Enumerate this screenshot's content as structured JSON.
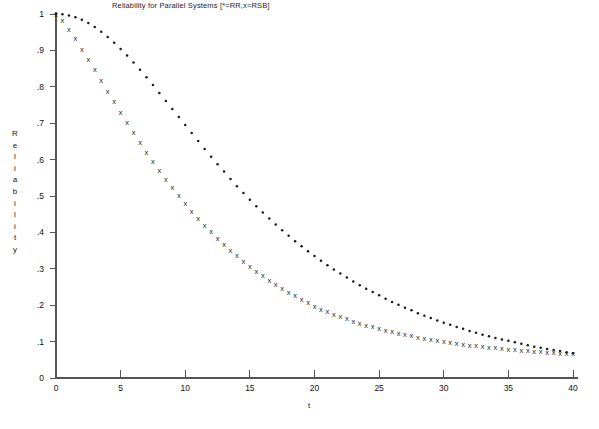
{
  "chart_data": {
    "type": "scatter",
    "title": "Reliability for Parallel Systems [*=RR,x=RSB]",
    "xlabel": "t",
    "ylabel": "Reliability",
    "ylabel_letters": [
      "R",
      "e",
      "l",
      "i",
      "a",
      "b",
      "i",
      "l",
      "i",
      "t",
      "y"
    ],
    "xlim": [
      0,
      40
    ],
    "ylim": [
      0,
      1
    ],
    "grid": false,
    "legend": "in-title",
    "xticks": [
      0,
      5,
      10,
      15,
      20,
      25,
      30,
      35,
      40
    ],
    "xtick_labels": [
      "0",
      "5",
      "10",
      "15",
      "20",
      "25",
      "30",
      "35",
      "40"
    ],
    "yticks": [
      0,
      0.1,
      0.2,
      0.3,
      0.4,
      0.5,
      0.6,
      0.7,
      0.8,
      0.9,
      1
    ],
    "ytick_labels": [
      "0",
      ".1",
      ".2",
      ".3",
      ".4",
      ".5",
      ".6",
      ".7",
      ".8",
      ".9",
      "1"
    ],
    "x": [
      0,
      0.5,
      1,
      1.5,
      2,
      2.5,
      3,
      3.5,
      4,
      4.5,
      5,
      5.5,
      6,
      6.5,
      7,
      7.5,
      8,
      8.5,
      9,
      9.5,
      10,
      10.5,
      11,
      11.5,
      12,
      12.5,
      13,
      13.5,
      14,
      14.5,
      15,
      15.5,
      16,
      16.5,
      17,
      17.5,
      18,
      18.5,
      19,
      19.5,
      20,
      20.5,
      21,
      21.5,
      22,
      22.5,
      23,
      23.5,
      24,
      24.5,
      25,
      25.5,
      26,
      26.5,
      27,
      27.5,
      28,
      28.5,
      29,
      29.5,
      30,
      30.5,
      31,
      31.5,
      32,
      32.5,
      33,
      33.5,
      34,
      34.5,
      35,
      35.5,
      36,
      36.5,
      37,
      37.5,
      38,
      38.5,
      39,
      39.5,
      40
    ],
    "series": [
      {
        "name": "RR",
        "marker": "*",
        "marker_name": "star-marker",
        "color": "#1a1a1a",
        "values": [
          1.0,
          0.999,
          0.996,
          0.991,
          0.984,
          0.975,
          0.964,
          0.951,
          0.937,
          0.921,
          0.904,
          0.886,
          0.867,
          0.847,
          0.826,
          0.805,
          0.783,
          0.761,
          0.739,
          0.717,
          0.695,
          0.673,
          0.651,
          0.629,
          0.608,
          0.587,
          0.567,
          0.547,
          0.527,
          0.508,
          0.49,
          0.472,
          0.455,
          0.438,
          0.422,
          0.406,
          0.391,
          0.376,
          0.362,
          0.348,
          0.335,
          0.322,
          0.31,
          0.298,
          0.287,
          0.276,
          0.265,
          0.255,
          0.245,
          0.236,
          0.227,
          0.218,
          0.209,
          0.201,
          0.193,
          0.186,
          0.178,
          0.171,
          0.165,
          0.158,
          0.152,
          0.146,
          0.14,
          0.135,
          0.129,
          0.124,
          0.119,
          0.115,
          0.11,
          0.106,
          0.102,
          0.098,
          0.094,
          0.09,
          0.086,
          0.083,
          0.08,
          0.077,
          0.074,
          0.071,
          0.068
        ]
      },
      {
        "name": "RSB",
        "marker": "x",
        "marker_name": "cross-marker",
        "color": "#1a1a1a",
        "values": [
          1.0,
          0.982,
          0.958,
          0.932,
          0.904,
          0.876,
          0.847,
          0.818,
          0.789,
          0.76,
          0.731,
          0.703,
          0.675,
          0.648,
          0.621,
          0.596,
          0.571,
          0.547,
          0.524,
          0.501,
          0.48,
          0.459,
          0.439,
          0.42,
          0.402,
          0.384,
          0.367,
          0.351,
          0.336,
          0.321,
          0.307,
          0.294,
          0.281,
          0.269,
          0.257,
          0.246,
          0.236,
          0.226,
          0.216,
          0.207,
          0.198,
          0.19,
          0.183,
          0.176,
          0.169,
          0.163,
          0.157,
          0.151,
          0.146,
          0.141,
          0.136,
          0.131,
          0.127,
          0.123,
          0.119,
          0.116,
          0.112,
          0.109,
          0.106,
          0.103,
          0.1,
          0.098,
          0.095,
          0.093,
          0.091,
          0.089,
          0.087,
          0.085,
          0.083,
          0.081,
          0.079,
          0.078,
          0.076,
          0.075,
          0.073,
          0.072,
          0.071,
          0.07,
          0.069,
          0.068,
          0.067
        ]
      }
    ]
  }
}
